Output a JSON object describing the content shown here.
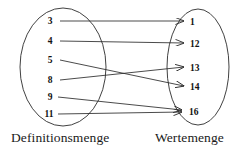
{
  "diagram": {
    "background_color": "#ffffff",
    "stroke_color": "#2b2b2b",
    "domain": {
      "label": "Definitionsmenge",
      "shape": "ellipse",
      "elements": [
        {
          "value": "3",
          "x": 50,
          "y": 24
        },
        {
          "value": "4",
          "x": 50,
          "y": 43
        },
        {
          "value": "5",
          "x": 50,
          "y": 63
        },
        {
          "value": "8",
          "x": 50,
          "y": 82
        },
        {
          "value": "9",
          "x": 50,
          "y": 99
        },
        {
          "value": "11",
          "x": 48,
          "y": 116
        }
      ]
    },
    "codomain": {
      "label": "Wertemenge",
      "shape": "ellipse",
      "elements": [
        {
          "value": "1",
          "x": 193,
          "y": 24
        },
        {
          "value": "12",
          "x": 193,
          "y": 46
        },
        {
          "value": "13",
          "x": 193,
          "y": 70
        },
        {
          "value": "14",
          "x": 193,
          "y": 89
        },
        {
          "value": "16",
          "x": 193,
          "y": 112
        }
      ]
    },
    "mappings": [
      {
        "from": "3",
        "to": "1"
      },
      {
        "from": "4",
        "to": "12"
      },
      {
        "from": "5",
        "to": "14"
      },
      {
        "from": "8",
        "to": "13"
      },
      {
        "from": "9",
        "to": "16"
      },
      {
        "from": "11",
        "to": "16"
      }
    ]
  }
}
